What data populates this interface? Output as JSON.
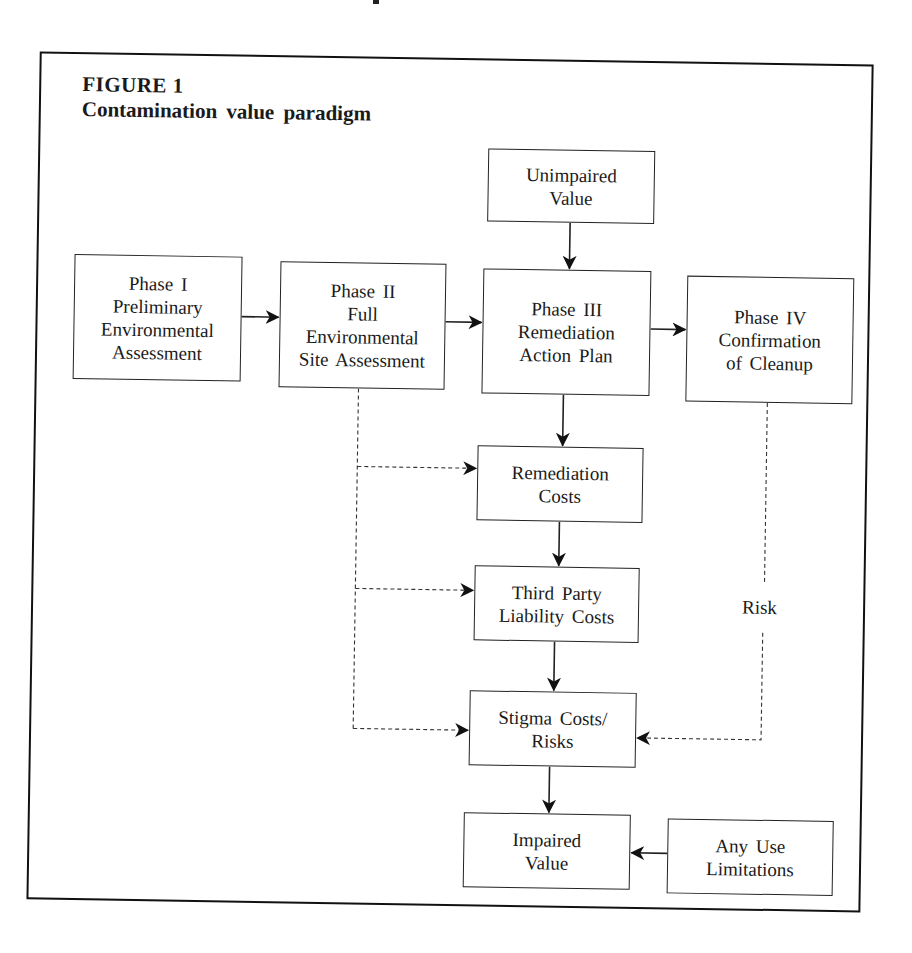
{
  "figure": {
    "label": "FIGURE 1",
    "title": "Contamination value paradigm"
  },
  "nodes": {
    "phase1": {
      "lines": [
        "Phase I",
        "Preliminary",
        "Environmental",
        "Assessment"
      ]
    },
    "phase2": {
      "lines": [
        "Phase II",
        "Full",
        "Environmental",
        "Site Assessment"
      ]
    },
    "unimpaired": {
      "lines": [
        "Unimpaired",
        "Value"
      ]
    },
    "phase3": {
      "lines": [
        "Phase III",
        "Remediation",
        "Action Plan"
      ]
    },
    "phase4": {
      "lines": [
        "Phase IV",
        "Confirmation",
        "of Cleanup"
      ]
    },
    "remediation_costs": {
      "lines": [
        "Remediation",
        "Costs"
      ]
    },
    "third_party": {
      "lines": [
        "Third Party",
        "Liability Costs"
      ]
    },
    "stigma": {
      "lines": [
        "Stigma Costs/",
        "Risks"
      ]
    },
    "impaired": {
      "lines": [
        "Impaired",
        "Value"
      ]
    },
    "any_use": {
      "lines": [
        "Any Use",
        "Limitations"
      ]
    }
  },
  "edge_labels": {
    "risk": "Risk"
  },
  "edges": [
    {
      "from": "Phase I",
      "to": "Phase II",
      "style": "solid"
    },
    {
      "from": "Phase II",
      "to": "Phase III",
      "style": "solid"
    },
    {
      "from": "Unimpaired Value",
      "to": "Phase III",
      "style": "solid"
    },
    {
      "from": "Phase III",
      "to": "Phase IV",
      "style": "solid"
    },
    {
      "from": "Phase III",
      "to": "Remediation Costs",
      "style": "solid"
    },
    {
      "from": "Remediation Costs",
      "to": "Third Party Liability Costs",
      "style": "solid"
    },
    {
      "from": "Third Party Liability Costs",
      "to": "Stigma Costs/Risks",
      "style": "solid"
    },
    {
      "from": "Stigma Costs/Risks",
      "to": "Impaired Value",
      "style": "solid"
    },
    {
      "from": "Any Use Limitations",
      "to": "Impaired Value",
      "style": "solid"
    },
    {
      "from": "Phase II",
      "to": "Remediation Costs",
      "style": "dashed"
    },
    {
      "from": "Phase II",
      "to": "Third Party Liability Costs",
      "style": "dashed"
    },
    {
      "from": "Phase II",
      "to": "Stigma Costs/Risks",
      "style": "dashed"
    },
    {
      "from": "Phase IV",
      "to": "Stigma Costs/Risks",
      "style": "dashed",
      "label": "Risk"
    }
  ]
}
